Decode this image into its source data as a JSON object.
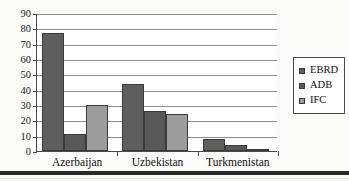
{
  "chart_data": {
    "type": "bar",
    "title": "",
    "subtitle": "",
    "xlabel": "",
    "ylabel": "",
    "categories": [
      "Azerbaijan",
      "Uzbekistan",
      "Turkmenistan"
    ],
    "series": [
      {
        "name": "EBRD",
        "values": [
          77,
          44,
          8
        ],
        "color": "#5e5e5e"
      },
      {
        "name": "ADB",
        "values": [
          11,
          26,
          4
        ],
        "color": "#585858"
      },
      {
        "name": "IFC",
        "values": [
          30,
          24,
          1
        ],
        "color": "#9d9d9d"
      }
    ],
    "ylim": [
      0,
      90
    ],
    "yticks": [
      0,
      10,
      20,
      30,
      40,
      50,
      60,
      70,
      80,
      90
    ],
    "ytick_labels": [
      "0",
      "10",
      "20",
      "30",
      "40",
      "50",
      "60",
      "70",
      "80",
      "90"
    ],
    "grid": true,
    "grid_axis": "y",
    "legend_position": "right",
    "legend_entries": [
      "EBRD",
      "ADB",
      "IFC"
    ]
  }
}
